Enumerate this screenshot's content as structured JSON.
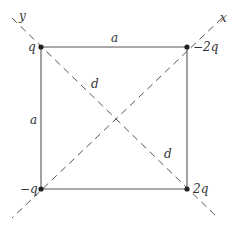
{
  "diagram": {
    "axes": {
      "x_label": "x",
      "y_label": "y"
    },
    "charges": {
      "top_left": "q",
      "top_right": "−2q",
      "bottom_left": "−q",
      "bottom_right": "2q"
    },
    "sides": {
      "top": "a",
      "left": "a"
    },
    "diagonals": {
      "upper": "d",
      "lower": "d"
    },
    "colors": {
      "line": "#555555",
      "dash": "#555555",
      "charge": "#222222",
      "text": "#333333"
    }
  }
}
